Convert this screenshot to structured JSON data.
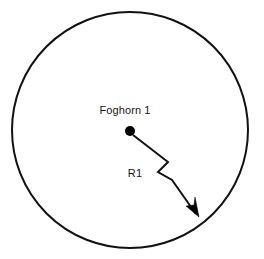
{
  "figure": {
    "type": "technical-diagram",
    "background_color": "#ffffff",
    "stroke_color": "#111111",
    "text_color": "#151515"
  },
  "coverage_area": {
    "shape": "circle",
    "center_x": 130,
    "center_y": 130,
    "radius": 118,
    "fill": "none",
    "stroke_width": 2
  },
  "source": {
    "label": "Foghorn 1",
    "marker": "filled-dot",
    "marker_x": 130,
    "marker_y": 131,
    "marker_radius": 5,
    "label_x": 125,
    "label_y": 114
  },
  "radius_annotation": {
    "label": "R1",
    "label_x": 135,
    "label_y": 177,
    "leader_points": "133,135 168,162 158,172 172,180 196,214",
    "arrow_tip_x": 199,
    "arrow_tip_y": 217,
    "arrow_points": "199,217 186,206 194,205 195,197"
  },
  "icons": {
    "dot_marker": "filled-circle-icon",
    "arrow_marker": "arrow-head-icon"
  }
}
